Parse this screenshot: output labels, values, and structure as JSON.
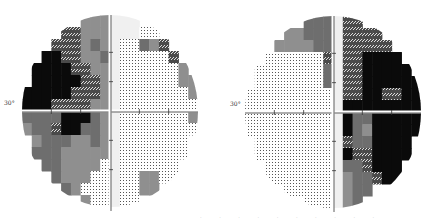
{
  "fields": [
    {
      "eye": "left-plot",
      "degree_label": "30°",
      "center": [
        110,
        111
      ],
      "radius": 88,
      "grid": [
        "......VVVWWW......",
        "....DDVVVWWWLL....",
        "...DDDVMVWLLMVD...",
        "..KKDDVVMWLLLLLD..",
        ".KKKKDDVVWLLLLLLV.",
        ".KKKKKDDVWLLLLLLVV",
        "KKKKKDDDVWLLLLLLLV",
        "KKKDDDDVVWLLLLLLLL",
        "MMMMKKKMVWLLLLLLLV",
        "VMMDKKMMVWLLLLLLLL",
        ".VMMMVVMVWLLLLLLL.",
        ".MMMVVVVVWLLLLLLL.",
        "..MMVVVVLWLLLLLL..",
        "...MVVVLLWLLVVLL..",
        "....MVLLLWLLVV....",
        "......VLLWLL......"
      ]
    },
    {
      "eye": "right-plot",
      "degree_label": "30°",
      "center": [
        333,
        112
      ],
      "radius": 88,
      "grid": [
        "......MMMWDD......",
        "....VVMMMWDDDD....",
        "...VVVVMMWDDDDD...",
        "..LLLLLLDWDDKKKK..",
        ".LLLLLLLMWDDKKKKK.",
        ".LLLLLLLMWDDKKKKKK",
        "LLLLLLLLLWDDKKDDKK",
        "LLLLLLLLLWKKKKKKKK",
        "LLLLLLLLLWKMMKKKKK",
        "LLLLLLLLLWKMVKKKKK",
        ".LLLLLLLLWDMMKKKK.",
        ".LLLLLLLLWKDDKKKK.",
        "..LLLLLLLWMMDKKK..",
        "..LLLLLLLWVMMDKK..",
        "....LLLLLWVMM.....",
        "......LLLWVM......"
      ]
    }
  ],
  "legend": {
    "K": "#0a0a0a",
    "D": "#3a3a3a",
    "M": "#6e6e6e",
    "V": "#8f8f8f",
    "L": "#d4d4d4",
    "W": "#f0f0f0"
  },
  "footer_text": "· · · · · · · · · ·"
}
